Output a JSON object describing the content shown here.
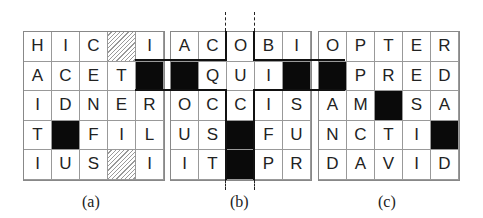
{
  "grids": [
    {
      "id": "a",
      "caption": "(a)",
      "rows": [
        [
          "H",
          "I",
          "C",
          "#hatch",
          "I"
        ],
        [
          "A",
          "C",
          "E",
          "T",
          "#black"
        ],
        [
          "I",
          "D",
          "N",
          "E",
          "R"
        ],
        [
          "T",
          "#black",
          "F",
          "I",
          "L"
        ],
        [
          "I",
          "U",
          "S",
          "#hatch",
          "I"
        ]
      ]
    },
    {
      "id": "b",
      "caption": "(b)",
      "rows": [
        [
          "A",
          "C",
          "O",
          "B",
          "I"
        ],
        [
          "#black",
          "Q",
          "U",
          "I",
          "#black"
        ],
        [
          "O",
          "C",
          "C",
          "I",
          "S"
        ],
        [
          "U",
          "S",
          "#black",
          "F",
          "U"
        ],
        [
          "I",
          "T",
          "#black",
          "P",
          "R"
        ]
      ]
    },
    {
      "id": "c",
      "caption": "(c)",
      "rows": [
        [
          "O",
          "P",
          "T",
          "E",
          "R"
        ],
        [
          "#black",
          "P",
          "R",
          "E",
          "D"
        ],
        [
          "A",
          "M",
          "#black",
          "S",
          "A"
        ],
        [
          "N",
          "C",
          "T",
          "I",
          "#black"
        ],
        [
          "D",
          "A",
          "V",
          "I",
          "D"
        ]
      ]
    }
  ],
  "cell_types": {
    "black": "filled-black",
    "hatch": "hatched"
  }
}
